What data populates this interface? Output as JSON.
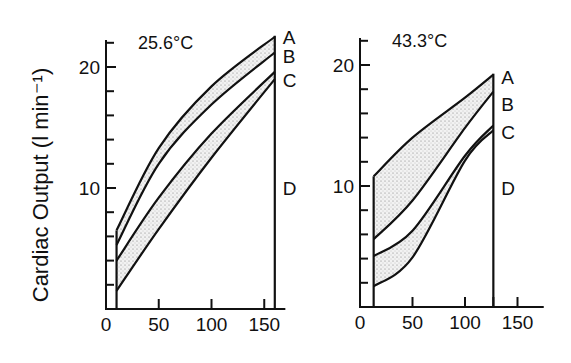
{
  "ylabel": "Cardiac Output (l min⁻¹)",
  "chart_data": [
    {
      "type": "area",
      "title": "25.6°C",
      "xlabel": "",
      "ylabel": "Cardiac Output (l min⁻¹)",
      "xlim": [
        0,
        170
      ],
      "ylim": [
        0,
        22.5
      ],
      "xticks": [
        0,
        50,
        100,
        150
      ],
      "yticks": [
        10,
        20
      ],
      "yminor": [
        2,
        4,
        6,
        8,
        12,
        14,
        16,
        18,
        22
      ],
      "x_start": 10,
      "x_end": 160,
      "series": [
        {
          "name": "A",
          "x": [
            10,
            50,
            100,
            160
          ],
          "values": [
            6.5,
            13.3,
            18.4,
            22.5
          ]
        },
        {
          "name": "B",
          "x": [
            10,
            50,
            100,
            160
          ],
          "values": [
            5.3,
            12.0,
            16.9,
            21.2
          ]
        },
        {
          "name": "C",
          "x": [
            10,
            50,
            100,
            160
          ],
          "values": [
            4.0,
            9.2,
            14.5,
            19.6
          ]
        },
        {
          "name": "D",
          "x": [
            10,
            50,
            100,
            160
          ],
          "values": [
            1.5,
            6.6,
            12.5,
            19.0
          ]
        }
      ],
      "shaded_bands": [
        [
          "A",
          "B"
        ],
        [
          "C",
          "D"
        ]
      ],
      "end_labels": [
        {
          "text": "A",
          "y": 22.5
        },
        {
          "text": "B",
          "y": 20.9
        },
        {
          "text": "C",
          "y": 18.9
        },
        {
          "text": "D",
          "y": 10.0
        }
      ]
    },
    {
      "type": "area",
      "title": "43.3°C",
      "xlabel": "",
      "ylabel": "",
      "xlim": [
        0,
        175
      ],
      "ylim": [
        0,
        22
      ],
      "xticks": [
        0,
        50,
        100,
        150
      ],
      "xminor": [
        127
      ],
      "yticks": [
        10,
        20
      ],
      "yminor": [
        2,
        4,
        6,
        8,
        12,
        14,
        16,
        18,
        22
      ],
      "x_start": 13,
      "x_end": 127,
      "series": [
        {
          "name": "A",
          "x": [
            13,
            50,
            100,
            127
          ],
          "values": [
            10.8,
            14.0,
            17.3,
            19.2
          ]
        },
        {
          "name": "B",
          "x": [
            13,
            50,
            100,
            127
          ],
          "values": [
            5.6,
            8.8,
            14.8,
            17.8
          ]
        },
        {
          "name": "C",
          "x": [
            13,
            50,
            100,
            127
          ],
          "values": [
            4.2,
            6.3,
            12.5,
            15.0
          ]
        },
        {
          "name": "D",
          "x": [
            13,
            50,
            100,
            127
          ],
          "values": [
            1.7,
            4.1,
            12.1,
            14.6
          ]
        }
      ],
      "shaded_bands": [
        [
          "A",
          "B"
        ],
        [
          "C",
          "D"
        ]
      ],
      "end_labels": [
        {
          "text": "A",
          "y": 19.0
        },
        {
          "text": "B",
          "y": 16.8
        },
        {
          "text": "C",
          "y": 14.5
        },
        {
          "text": "D",
          "y": 9.8
        }
      ]
    }
  ]
}
